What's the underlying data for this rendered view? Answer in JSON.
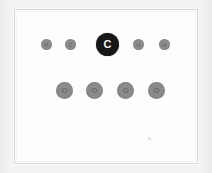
{
  "canvas": {
    "width": 212,
    "height": 173,
    "background_color": "#f2f0ee",
    "panel_background_color": "#fdfdfc",
    "panel_border_color": "#d9d7d5"
  },
  "panel": {
    "name": "node-diagram-panel"
  },
  "diagram": {
    "title": "",
    "rows": [
      {
        "name": "top-row",
        "nodes": [
          {
            "label": "R",
            "kind": "small",
            "color": "#8d8d8d",
            "text_color": "#6f6f6f",
            "x": 40,
            "y": 38,
            "size": 11
          },
          {
            "label": "C",
            "kind": "small",
            "color": "#8d8d8d",
            "text_color": "#6f6f6f",
            "x": 64,
            "y": 38,
            "size": 11
          },
          {
            "label": "C",
            "kind": "primary",
            "color": "#171717",
            "text_color": "#f4f4f4",
            "x": 95,
            "y": 32,
            "size": 23
          },
          {
            "label": "H",
            "kind": "small",
            "color": "#8d8d8d",
            "text_color": "#6f6f6f",
            "x": 132,
            "y": 38,
            "size": 11
          },
          {
            "label": "H",
            "kind": "small",
            "color": "#8d8d8d",
            "text_color": "#6f6f6f",
            "x": 158,
            "y": 38,
            "size": 11
          }
        ]
      },
      {
        "name": "bottom-row",
        "nodes": [
          {
            "label": "O",
            "kind": "medium",
            "color": "#8a8a8a",
            "text_color": "#6b6b6b",
            "x": 55,
            "y": 81,
            "size": 17
          },
          {
            "label": "O",
            "kind": "medium",
            "color": "#8a8a8a",
            "text_color": "#6b6b6b",
            "x": 85,
            "y": 81,
            "size": 17
          },
          {
            "label": "O",
            "kind": "medium",
            "color": "#8a8a8a",
            "text_color": "#6b6b6b",
            "x": 116,
            "y": 81,
            "size": 17
          },
          {
            "label": "O",
            "kind": "medium",
            "color": "#8a8a8a",
            "text_color": "#6b6b6b",
            "x": 147,
            "y": 81,
            "size": 17
          }
        ]
      }
    ],
    "speck": {
      "name": "faint-speck",
      "x": 147,
      "y": 136
    }
  }
}
